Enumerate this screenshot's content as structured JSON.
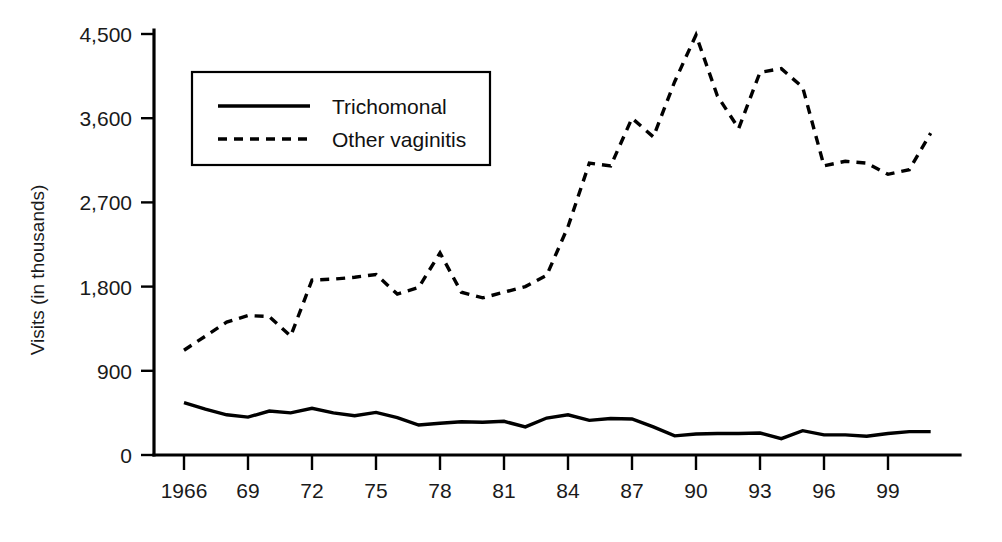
{
  "chart_data": {
    "type": "line",
    "title": "",
    "xlabel": "",
    "ylabel": "Visits (in thousands)",
    "ylim": [
      0,
      4500
    ],
    "yticks": [
      0,
      900,
      1800,
      2700,
      3600,
      4500
    ],
    "ytick_labels": [
      "0",
      "900",
      "1,800",
      "2,700",
      "3,600",
      "4,500"
    ],
    "xlim": [
      1966,
      2001
    ],
    "xticks": [
      1966,
      1969,
      1972,
      1975,
      1978,
      1981,
      1984,
      1987,
      1990,
      1993,
      1996,
      1999
    ],
    "xtick_labels": [
      "1966",
      "69",
      "72",
      "75",
      "78",
      "81",
      "84",
      "87",
      "90",
      "93",
      "96",
      "99"
    ],
    "grid": false,
    "legend_position": "upper-left-inset",
    "x": [
      1966,
      1967,
      1968,
      1969,
      1970,
      1971,
      1972,
      1973,
      1974,
      1975,
      1976,
      1977,
      1978,
      1979,
      1980,
      1981,
      1982,
      1983,
      1984,
      1985,
      1986,
      1987,
      1988,
      1989,
      1990,
      1991,
      1992,
      1993,
      1994,
      1995,
      1996,
      1997,
      1998,
      1999,
      2000,
      2001
    ],
    "series": [
      {
        "name": "Trichomonal",
        "style": "solid",
        "color": "#000000",
        "values": [
          560,
          490,
          430,
          405,
          470,
          450,
          500,
          450,
          420,
          455,
          400,
          320,
          340,
          355,
          350,
          360,
          300,
          395,
          430,
          370,
          390,
          385,
          300,
          205,
          225,
          230,
          230,
          235,
          175,
          260,
          215,
          215,
          200,
          230,
          250,
          250
        ]
      },
      {
        "name": "Other vaginitis",
        "style": "dashed",
        "color": "#000000",
        "values": [
          1120,
          1270,
          1420,
          1490,
          1480,
          1270,
          1870,
          1880,
          1900,
          1930,
          1720,
          1790,
          2160,
          1740,
          1680,
          1740,
          1800,
          1920,
          2440,
          3120,
          3090,
          3600,
          3400,
          3990,
          4490,
          3840,
          3490,
          4090,
          4130,
          3930,
          3090,
          3140,
          3120,
          3000,
          3050,
          3440
        ]
      }
    ],
    "annotations": []
  },
  "legend": {
    "entries": [
      {
        "label": "Trichomonal",
        "style": "solid"
      },
      {
        "label": "Other vaginitis",
        "style": "dashed"
      }
    ]
  }
}
